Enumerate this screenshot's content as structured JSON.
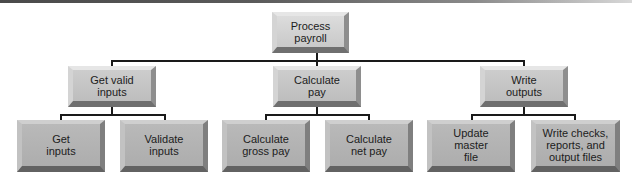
{
  "diagram": {
    "type": "hierarchy-chart",
    "root": {
      "id": "process-payroll",
      "label": "Process\npayroll"
    },
    "level1": [
      {
        "id": "get-valid-inputs",
        "label": "Get valid\ninputs"
      },
      {
        "id": "calculate-pay",
        "label": "Calculate\npay"
      },
      {
        "id": "write-outputs",
        "label": "Write\noutputs"
      }
    ],
    "level2": [
      {
        "id": "get-inputs",
        "parent": "get-valid-inputs",
        "label": "Get\ninputs"
      },
      {
        "id": "validate-inputs",
        "parent": "get-valid-inputs",
        "label": "Validate\ninputs"
      },
      {
        "id": "calculate-gross-pay",
        "parent": "calculate-pay",
        "label": "Calculate\ngross pay"
      },
      {
        "id": "calculate-net-pay",
        "parent": "calculate-pay",
        "label": "Calculate\nnet pay"
      },
      {
        "id": "update-master-file",
        "parent": "write-outputs",
        "label": "Update\nmaster\nfile"
      },
      {
        "id": "write-checks-reports",
        "parent": "write-outputs",
        "label": "Write checks,\nreports, and\noutput files"
      }
    ]
  }
}
